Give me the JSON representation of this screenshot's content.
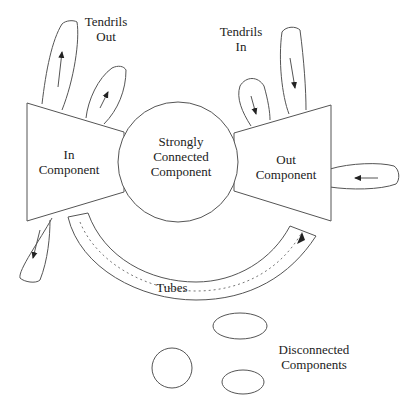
{
  "diagram": {
    "labels": {
      "tendrils_out": [
        "Tendrils",
        "Out"
      ],
      "tendrils_in": [
        "Tendrils",
        "In"
      ],
      "in_component": [
        "In",
        "Component"
      ],
      "scc": [
        "Strongly",
        "Connected",
        "Component"
      ],
      "out_component": [
        "Out",
        "Component"
      ],
      "tubes": "Tubes",
      "disconnected": [
        "Disconnected",
        "Components"
      ]
    },
    "nodes": [
      {
        "id": "in_component",
        "shape": "trapezoid"
      },
      {
        "id": "scc",
        "shape": "circle"
      },
      {
        "id": "out_component",
        "shape": "trapezoid"
      },
      {
        "id": "tubes",
        "shape": "arc-band"
      },
      {
        "id": "tendril_out_1",
        "shape": "lobe",
        "arrow": "up"
      },
      {
        "id": "tendril_out_2",
        "shape": "lobe",
        "arrow": "up-right"
      },
      {
        "id": "tendril_in_1",
        "shape": "lobe",
        "arrow": "down"
      },
      {
        "id": "tendril_in_2",
        "shape": "lobe",
        "arrow": "down"
      },
      {
        "id": "tendril_right",
        "shape": "lobe",
        "arrow": "left"
      },
      {
        "id": "tendril_bottom_left",
        "shape": "lobe",
        "arrow": "down"
      },
      {
        "id": "disconnected_1",
        "shape": "ellipse"
      },
      {
        "id": "disconnected_2",
        "shape": "circle"
      },
      {
        "id": "disconnected_3",
        "shape": "ellipse"
      }
    ],
    "colors": {
      "line": "#555555",
      "text": "#222222",
      "background": "#ffffff"
    }
  }
}
